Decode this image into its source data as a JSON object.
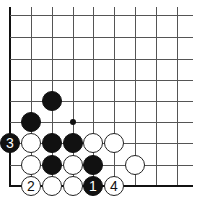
{
  "diagram": {
    "type": "go-board-corner",
    "grid": {
      "columns_x": [
        10,
        31,
        52,
        73,
        93,
        114,
        135,
        156,
        177
      ],
      "rows_y": [
        15,
        37,
        59,
        80,
        101,
        122,
        143,
        165,
        186
      ],
      "right_extent": 193,
      "top_extent": 7,
      "left_edge": true,
      "bottom_edge": true
    },
    "colors": {
      "black": "#111111",
      "white": "#ffffff",
      "line": "#555555"
    },
    "stones": [
      {
        "color": "black",
        "col": 2,
        "row": 4,
        "label": ""
      },
      {
        "color": "black",
        "col": 1,
        "row": 5,
        "label": ""
      },
      {
        "color": "black",
        "col": 0,
        "row": 6,
        "label": "3"
      },
      {
        "color": "white",
        "col": 1,
        "row": 6,
        "label": ""
      },
      {
        "color": "black",
        "col": 2,
        "row": 6,
        "label": ""
      },
      {
        "color": "black",
        "col": 3,
        "row": 6,
        "label": ""
      },
      {
        "color": "white",
        "col": 4,
        "row": 6,
        "label": ""
      },
      {
        "color": "white",
        "col": 5,
        "row": 6,
        "label": ""
      },
      {
        "color": "white",
        "col": 1,
        "row": 7,
        "label": ""
      },
      {
        "color": "black",
        "col": 2,
        "row": 7,
        "label": ""
      },
      {
        "color": "white",
        "col": 3,
        "row": 7,
        "label": ""
      },
      {
        "color": "black",
        "col": 4,
        "row": 7,
        "label": ""
      },
      {
        "color": "white",
        "col": 6,
        "row": 7,
        "label": ""
      },
      {
        "color": "white",
        "col": 1,
        "row": 8,
        "label": "2"
      },
      {
        "color": "white",
        "col": 2,
        "row": 8,
        "label": ""
      },
      {
        "color": "white",
        "col": 3,
        "row": 8,
        "label": ""
      },
      {
        "color": "black",
        "col": 4,
        "row": 8,
        "label": "1"
      },
      {
        "color": "white",
        "col": 5,
        "row": 8,
        "label": "4"
      }
    ],
    "markers": [
      {
        "type": "dot",
        "col": 3,
        "row": 5
      }
    ]
  }
}
